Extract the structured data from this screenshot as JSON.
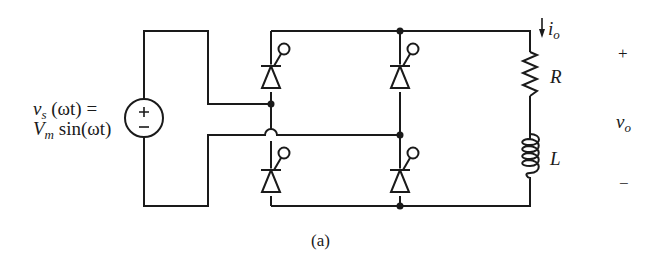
{
  "figure": {
    "caption": "(a)",
    "source": {
      "label_line1_var": "v",
      "label_line1_sub": "s",
      "label_line1_rest": " (ωt) =",
      "label_line2_var": "V",
      "label_line2_sub": "m",
      "label_line2_rest": " sin(ωt)",
      "plus": "+",
      "minus": "−"
    },
    "load": {
      "resistor_label": "R",
      "inductor_label": "L",
      "current_var": "i",
      "current_sub": "o"
    },
    "output": {
      "plus": "+",
      "voltage_var": "v",
      "voltage_sub": "o",
      "minus": "−"
    },
    "components": [
      "SCR-top-left",
      "SCR-top-right",
      "SCR-bottom-left",
      "SCR-bottom-right",
      "AC voltage source",
      "Resistor R",
      "Inductor L"
    ],
    "colors": {
      "stroke": "#1a1a1a",
      "background": "#ffffff"
    }
  }
}
